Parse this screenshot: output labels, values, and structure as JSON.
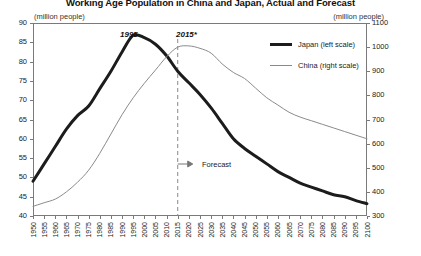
{
  "chart_data": {
    "type": "line",
    "title": "Working Age Population in China and Japan, Actual and Forecast",
    "unit_left": "(million people)",
    "unit_right": "(million people)",
    "xlabel": "",
    "ylabel_left": "(million people)",
    "ylabel_right": "(million people)",
    "grid": false,
    "legend_position": "top-right",
    "ylim_left": [
      40,
      90
    ],
    "ylim_right": [
      300,
      1100
    ],
    "xlim": [
      1950,
      2100
    ],
    "yticks_left": [
      90,
      85,
      80,
      75,
      70,
      65,
      60,
      55,
      50,
      45,
      40
    ],
    "yticks_right": [
      1100,
      1000,
      900,
      800,
      700,
      600,
      500,
      400,
      300
    ],
    "x": [
      1950,
      1955,
      1960,
      1965,
      1970,
      1975,
      1980,
      1985,
      1990,
      1995,
      2000,
      2005,
      2010,
      2015,
      2020,
      2025,
      2030,
      2035,
      2040,
      2045,
      2050,
      2055,
      2060,
      2065,
      2070,
      2075,
      2080,
      2085,
      2090,
      2095,
      2100
    ],
    "xticks": [
      "1950",
      "1955",
      "1960",
      "1965",
      "1970",
      "1975",
      "1980",
      "1985",
      "1990",
      "1995",
      "2000",
      "2005",
      "2010",
      "2015",
      "2020",
      "2025",
      "2030",
      "2035",
      "2040",
      "2045",
      "2050",
      "2055",
      "2060",
      "2065",
      "2070",
      "2075",
      "2080",
      "2085",
      "2090",
      "2095",
      "2100"
    ],
    "series": [
      {
        "name": "Japan (left scale)",
        "axis": "left",
        "color": "#1c1c1c",
        "width": 3,
        "values": [
          49.0,
          53.5,
          58.0,
          62.5,
          66.0,
          68.5,
          73.0,
          77.5,
          82.5,
          86.8,
          86.2,
          84.5,
          81.5,
          77.5,
          74.5,
          71.5,
          68.0,
          64.0,
          60.0,
          57.5,
          55.5,
          53.5,
          51.5,
          50.0,
          48.5,
          47.5,
          46.5,
          45.5,
          45.0,
          44.0,
          43.2
        ]
      },
      {
        "name": "China (right scale)",
        "axis": "right",
        "color": "#8a8a8a",
        "width": 1,
        "values": [
          340,
          355,
          370,
          400,
          440,
          490,
          560,
          640,
          720,
          790,
          850,
          905,
          960,
          1000,
          1005,
          995,
          975,
          930,
          895,
          870,
          830,
          790,
          760,
          730,
          710,
          695,
          680,
          665,
          650,
          635,
          620
        ]
      }
    ],
    "annotations": [
      {
        "name": "peak-japan",
        "label": "1995",
        "x": 1995
      },
      {
        "name": "forecast-start",
        "label": "2015*",
        "x": 2015
      },
      {
        "name": "forecast-marker",
        "label": "Forecast",
        "x": 2015
      }
    ]
  }
}
